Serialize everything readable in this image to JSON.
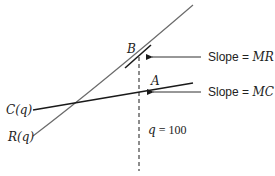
{
  "diagram": {
    "curves": {
      "revenue": {
        "label": "R(q)",
        "color": "#6b6b6b"
      },
      "cost": {
        "label": "C(q)",
        "color": "#1a1a1a"
      }
    },
    "points": {
      "B": {
        "label": "B"
      },
      "A": {
        "label": "A"
      }
    },
    "annotations": {
      "slope_mr": {
        "prefix": "Slope = ",
        "var": "MR"
      },
      "slope_mc": {
        "prefix": "Slope = ",
        "var": "MC"
      },
      "q_marker": {
        "var": "q",
        "eq": " = ",
        "value": "100"
      }
    },
    "colors": {
      "line": "#1a1a1a",
      "curve": "#6b6b6b",
      "text": "#222222"
    }
  }
}
